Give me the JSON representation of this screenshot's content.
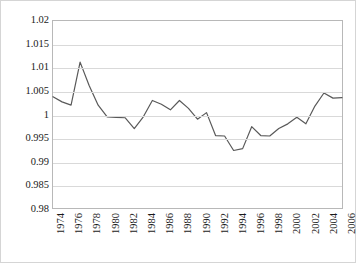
{
  "chart_data": {
    "type": "line",
    "title": "",
    "xlabel": "",
    "ylabel": "",
    "ylim": [
      0.98,
      1.02
    ],
    "xlim": [
      1974,
      2006
    ],
    "grid": true,
    "legend": false,
    "y_ticks": [
      "1.02",
      "1.015",
      "1.01",
      "1.005",
      "1",
      "0.995",
      "0.99",
      "0.985",
      "0.98"
    ],
    "y_tick_values": [
      1.02,
      1.015,
      1.01,
      1.005,
      1.0,
      0.995,
      0.99,
      0.985,
      0.98
    ],
    "x_ticks": [
      "1974",
      "1976",
      "1978",
      "1980",
      "1982",
      "1984",
      "1986",
      "1988",
      "1990",
      "1992",
      "1994",
      "1996",
      "1998",
      "2000",
      "2002",
      "2004",
      "2006"
    ],
    "x_tick_values": [
      1974,
      1976,
      1978,
      1980,
      1982,
      1984,
      1986,
      1988,
      1990,
      1992,
      1994,
      1996,
      1998,
      2000,
      2002,
      2004,
      2006
    ],
    "series": [
      {
        "name": "index",
        "color": "#595959",
        "x": [
          1974,
          1975,
          1976,
          1977,
          1978,
          1979,
          1980,
          1981,
          1982,
          1983,
          1984,
          1985,
          1986,
          1987,
          1988,
          1989,
          1990,
          1991,
          1992,
          1993,
          1994,
          1995,
          1996,
          1997,
          1998,
          1999,
          2000,
          2001,
          2002,
          2003,
          2004,
          2005,
          2006
        ],
        "values": [
          1.0038,
          1.0027,
          1.002,
          1.0112,
          1.0062,
          1.002,
          0.9995,
          0.9994,
          0.9993,
          0.997,
          0.9995,
          1.003,
          1.0022,
          1.001,
          1.003,
          1.0013,
          0.999,
          1.0004,
          0.9955,
          0.9954,
          0.9923,
          0.9927,
          0.9974,
          0.9955,
          0.9954,
          0.997,
          0.998,
          0.9994,
          0.998,
          1.0018,
          1.0046,
          1.0035,
          1.0036
        ]
      }
    ]
  }
}
